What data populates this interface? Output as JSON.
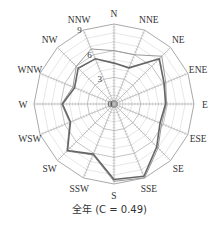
{
  "chart_data": {
    "type": "radar",
    "title": "全年 (C = 0.49)",
    "caption": "全年 (C = 0.49)",
    "directions": [
      "N",
      "NNE",
      "NE",
      "ENE",
      "E",
      "ESE",
      "SE",
      "SSE",
      "S",
      "SSW",
      "SW",
      "WSW",
      "W",
      "WNW",
      "NW",
      "NNW"
    ],
    "radial_ticks": [
      0,
      3,
      6,
      9
    ],
    "rlim": [
      0,
      9
    ],
    "series": [
      {
        "name": "dark",
        "color": "#666666",
        "width": 1.6,
        "values": [
          4.6,
          4.4,
          7.2,
          6.1,
          5.8,
          5.6,
          6.8,
          8.8,
          8.5,
          6.1,
          7.4,
          5.3,
          5.8,
          4.8,
          5.7,
          5.5
        ]
      },
      {
        "name": "light",
        "color": "#9a9a9a",
        "width": 1.0,
        "values": [
          6.0,
          6.0,
          7.6,
          6.3,
          5.9,
          5.8,
          7.0,
          9.0,
          8.7,
          6.2,
          7.5,
          5.4,
          5.9,
          5.0,
          6.0,
          6.7
        ]
      }
    ],
    "grid": true,
    "calm_center": true
  },
  "caption_text": "全年 (C = 0.49)"
}
